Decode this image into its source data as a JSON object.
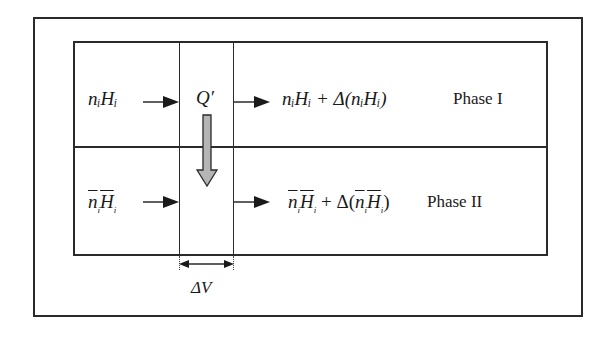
{
  "diagram": {
    "phase1": {
      "inflow_label": "nᵢHᵢ",
      "heat_label": "Q′",
      "outflow_label": "nᵢHᵢ + Δ(nᵢHᵢ)",
      "phase_label": "Phase I"
    },
    "phase2": {
      "inflow_label": "n̄ᵢH̄ᵢ",
      "outflow_label": "n̄ᵢH̄ᵢ + Δ(n̄ᵢH̄ᵢ)",
      "phase_label": "Phase II"
    },
    "volume_element_label": "ΔV",
    "colors": {
      "line": "#2a2a2a",
      "heat_arrow_fill": "#b5b5b5",
      "background": "#ffffff"
    }
  }
}
